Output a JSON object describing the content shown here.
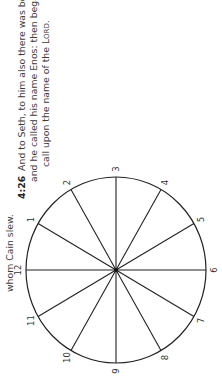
{
  "page": {
    "orientation": "rotated-90-clockwise"
  },
  "text": {
    "previous_fragment": "whom Cain slew.",
    "verse": {
      "number": "4:26",
      "line1": "And to Seth, to him also there was born a son;",
      "line2": "and he called his name Enos: then began men to",
      "line3_prefix": "call upon the name of the ",
      "line3_lord": "Lord",
      "line3_suffix": "."
    }
  },
  "diagram": {
    "type": "clock-circle",
    "center": [
      116,
      270
    ],
    "radius": 91,
    "spokes": 12,
    "labels": [
      "1",
      "2",
      "3",
      "4",
      "5",
      "6",
      "7",
      "8",
      "9",
      "10",
      "11",
      "12"
    ],
    "stroke_color": "#222222"
  }
}
